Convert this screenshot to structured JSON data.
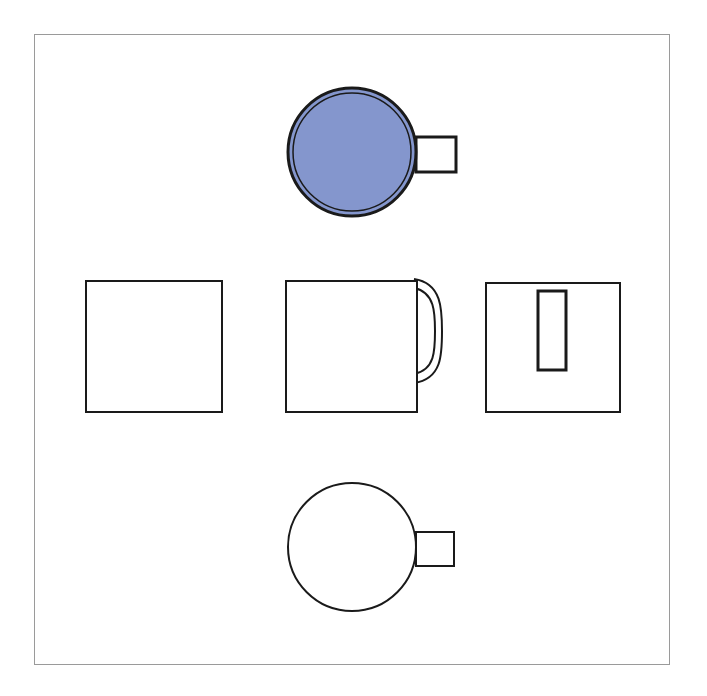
{
  "document": {
    "type": "orthographic-projection-drawing",
    "subject": "mug",
    "title": "",
    "background_color": "#ffffff",
    "frame": {
      "name": "drawing-border",
      "x": 34,
      "y": 34,
      "width": 636,
      "height": 631,
      "stroke_color": "#9a9a9a",
      "stroke_width": 1,
      "fill": "#ffffff"
    },
    "stroke_color": "#1a1a1a",
    "accent_fill": "#8496cd"
  },
  "views": [
    {
      "id": "top-view",
      "label": "Top view",
      "shape": "circle-with-rectangular-handle",
      "filled": true,
      "fill_color": "#8496cd",
      "double_outline": true,
      "circle": {
        "cx": 352,
        "cy": 152,
        "r": 64
      },
      "inner_circle": {
        "cx": 352,
        "cy": 152,
        "r": 59
      },
      "handle": {
        "x": 416,
        "y": 137,
        "width": 40,
        "height": 35
      },
      "stroke_width": 3
    },
    {
      "id": "left-side-view",
      "label": "Left side view",
      "shape": "square",
      "filled": false,
      "fill_color": "#ffffff",
      "rect": {
        "x": 86,
        "y": 281,
        "width": 136,
        "height": 131
      },
      "stroke_width": 2
    },
    {
      "id": "front-view",
      "label": "Front view",
      "shape": "square-with-arc-handle",
      "filled": false,
      "fill_color": "#ffffff",
      "rect": {
        "x": 286,
        "y": 281,
        "width": 131,
        "height": 131
      },
      "handle_outer": {
        "cx": 417,
        "cy": 331,
        "rx": 25,
        "ry": 52
      },
      "handle_inner": {
        "cx": 417,
        "cy": 331,
        "rx": 18,
        "ry": 43
      },
      "stroke_width": 2
    },
    {
      "id": "rear-view",
      "label": "Rear view",
      "shape": "square-with-inner-rectangle",
      "filled": false,
      "fill_color": "#ffffff",
      "rect": {
        "x": 486,
        "y": 283,
        "width": 134,
        "height": 129
      },
      "inner_rect": {
        "x": 538,
        "y": 291,
        "width": 28,
        "height": 79
      },
      "stroke_width": 2
    },
    {
      "id": "bottom-view",
      "label": "Bottom view",
      "shape": "circle-with-rectangular-handle",
      "filled": false,
      "fill_color": "#ffffff",
      "double_outline": false,
      "circle": {
        "cx": 352,
        "cy": 547,
        "r": 64
      },
      "handle": {
        "x": 416,
        "y": 532,
        "width": 38,
        "height": 34
      },
      "stroke_width": 2
    }
  ]
}
